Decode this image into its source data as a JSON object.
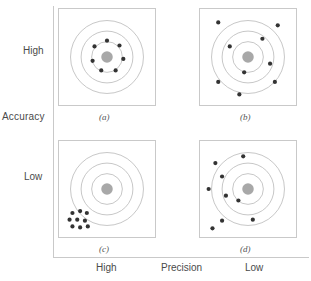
{
  "figure": {
    "axes": {
      "y_label": "Accuracy",
      "y_ticks": [
        "High",
        "Low"
      ],
      "x_label": "Precision",
      "x_ticks": [
        "High",
        "Low"
      ]
    },
    "style": {
      "dot_color": "#333333",
      "bullseye_color": "#a8a8a8",
      "ring_color": "#b9b9b9",
      "frame_color": "#c9c9c9",
      "text_color": "#4a4a4a",
      "background": "#ffffff"
    }
  },
  "chart_data": {
    "type": "scatter",
    "xlabel": "Precision",
    "ylabel": "Accuracy",
    "xlim": [
      0,
      100
    ],
    "ylim": [
      0,
      100
    ],
    "grid": false,
    "legend": "none",
    "target": {
      "center": [
        50,
        50
      ],
      "bullseye_radius": 6,
      "ring_radii": [
        16,
        27,
        38
      ]
    },
    "panels": [
      {
        "id": "a",
        "caption": "(a)",
        "accuracy": "High",
        "precision": "High",
        "n_points": 7,
        "points": [
          [
            50,
            33
          ],
          [
            63,
            38
          ],
          [
            67,
            52
          ],
          [
            59,
            64
          ],
          [
            44,
            64
          ],
          [
            35,
            54
          ],
          [
            37,
            39
          ]
        ]
      },
      {
        "id": "b",
        "caption": "(b)",
        "accuracy": "High",
        "precision": "Low",
        "n_points": 9,
        "points": [
          [
            19,
            14
          ],
          [
            81,
            17
          ],
          [
            65,
            31
          ],
          [
            31,
            39
          ],
          [
            73,
            57
          ],
          [
            46,
            66
          ],
          [
            19,
            76
          ],
          [
            78,
            76
          ],
          [
            41,
            89
          ]
        ]
      },
      {
        "id": "c",
        "caption": "(c)",
        "accuracy": "Low",
        "precision": "High",
        "n_points": 9,
        "points": [
          [
            14,
            75
          ],
          [
            22,
            73
          ],
          [
            29,
            75
          ],
          [
            11,
            82
          ],
          [
            19,
            82
          ],
          [
            27,
            83
          ],
          [
            14,
            89
          ],
          [
            22,
            90
          ],
          [
            30,
            89
          ]
        ]
      },
      {
        "id": "d",
        "caption": "(d)",
        "accuracy": "Low",
        "precision": "Low",
        "n_points": 9,
        "points": [
          [
            45,
            16
          ],
          [
            16,
            23
          ],
          [
            23,
            37
          ],
          [
            9,
            50
          ],
          [
            27,
            57
          ],
          [
            40,
            62
          ],
          [
            23,
            83
          ],
          [
            55,
            82
          ],
          [
            13,
            91
          ]
        ]
      }
    ]
  }
}
